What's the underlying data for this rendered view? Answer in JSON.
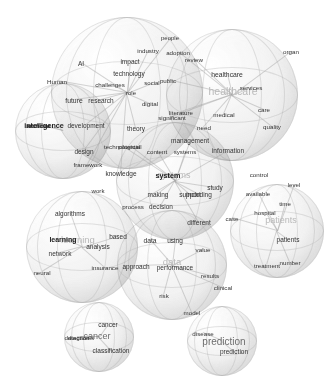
{
  "figure": {
    "title": "",
    "type": "bubble-word-cloud",
    "background_color": "#ffffff",
    "bubble_fill": "#ececec",
    "bubble_edge": "#c8c8c8",
    "topic_label_color": "#b9b9b9",
    "word_color": "#3c3c3c"
  },
  "chart_data": {
    "type": "scatter",
    "title": "",
    "xlabel": "",
    "ylabel": "",
    "grid": false,
    "legend": "none",
    "clusters": [
      {
        "id": "artificial-intelligence",
        "topic_label": "artificial intelligence",
        "label_text": "intelligence",
        "cx": 63,
        "cy": 131,
        "r": 48,
        "words": [
          {
            "text": "intelligence",
            "x": 44,
            "y": 125,
            "size": 7.2,
            "weight": "bold"
          },
          {
            "text": "artificial",
            "x": 38,
            "y": 125,
            "size": 6.2,
            "weight": "bold"
          }
        ]
      },
      {
        "id": "technology-adoption",
        "topic_label": "",
        "label_text": "",
        "cx": 127,
        "cy": 93,
        "r": 76,
        "words": [
          {
            "text": "AI",
            "x": 81,
            "y": 63,
            "size": 6.5,
            "weight": "normal"
          },
          {
            "text": "Human",
            "x": 57,
            "y": 81,
            "size": 6.2,
            "weight": "normal"
          },
          {
            "text": "impact",
            "x": 130,
            "y": 61,
            "size": 6.5,
            "weight": "normal"
          },
          {
            "text": "industry",
            "x": 148,
            "y": 50,
            "size": 6.2,
            "weight": "normal"
          },
          {
            "text": "technology",
            "x": 129,
            "y": 73,
            "size": 6.5,
            "weight": "normal"
          },
          {
            "text": "challenges",
            "x": 110,
            "y": 84,
            "size": 6.2,
            "weight": "normal"
          },
          {
            "text": "role",
            "x": 131,
            "y": 93,
            "size": 6.0,
            "weight": "normal"
          },
          {
            "text": "social",
            "x": 152,
            "y": 83,
            "size": 6.0,
            "weight": "normal"
          },
          {
            "text": "future",
            "x": 74,
            "y": 100,
            "size": 6.8,
            "weight": "normal"
          },
          {
            "text": "research",
            "x": 101,
            "y": 100,
            "size": 6.5,
            "weight": "normal"
          },
          {
            "text": "development",
            "x": 86,
            "y": 125,
            "size": 6.5,
            "weight": "normal"
          },
          {
            "text": "theory",
            "x": 136,
            "y": 128,
            "size": 6.5,
            "weight": "normal"
          },
          {
            "text": "digital",
            "x": 150,
            "y": 103,
            "size": 6.2,
            "weight": "normal"
          },
          {
            "text": "design",
            "x": 84,
            "y": 151,
            "size": 6.5,
            "weight": "normal"
          },
          {
            "text": "framework",
            "x": 88,
            "y": 164,
            "size": 6.2,
            "weight": "normal"
          },
          {
            "text": "knowledge",
            "x": 121,
            "y": 173,
            "size": 6.5,
            "weight": "normal"
          },
          {
            "text": "work",
            "x": 98,
            "y": 190,
            "size": 6.2,
            "weight": "normal"
          },
          {
            "text": "people",
            "x": 170,
            "y": 38,
            "size": 6.0,
            "weight": "normal"
          }
        ]
      },
      {
        "id": "healthcare",
        "topic_label": "healthcare",
        "label_text": "healthcare",
        "cx": 232,
        "cy": 95,
        "r": 66,
        "words": [
          {
            "text": "healthcare",
            "x": 227,
            "y": 74,
            "size": 6.8,
            "weight": "normal"
          },
          {
            "text": "healthcare",
            "x": 233,
            "y": 91,
            "size": 10.5,
            "weight": "label"
          },
          {
            "text": "services",
            "x": 251,
            "y": 87,
            "size": 6.2,
            "weight": "normal"
          },
          {
            "text": "adoption",
            "x": 178,
            "y": 52,
            "size": 6.2,
            "weight": "normal"
          },
          {
            "text": "review",
            "x": 194,
            "y": 59,
            "size": 6.2,
            "weight": "normal"
          },
          {
            "text": "public",
            "x": 168,
            "y": 80,
            "size": 6.2,
            "weight": "normal"
          },
          {
            "text": "medical",
            "x": 224,
            "y": 114,
            "size": 6.2,
            "weight": "normal"
          },
          {
            "text": "care",
            "x": 264,
            "y": 109,
            "size": 6.2,
            "weight": "normal"
          },
          {
            "text": "quality",
            "x": 272,
            "y": 126,
            "size": 6.2,
            "weight": "normal"
          },
          {
            "text": "organ",
            "x": 291,
            "y": 51,
            "size": 6.2,
            "weight": "normal"
          },
          {
            "text": "literature",
            "x": 181,
            "y": 112,
            "size": 6.2,
            "weight": "normal"
          },
          {
            "text": "significant",
            "x": 172,
            "y": 117,
            "size": 6.2,
            "weight": "normal"
          },
          {
            "text": "need",
            "x": 204,
            "y": 127,
            "size": 6.2,
            "weight": "normal"
          }
        ]
      },
      {
        "id": "systems",
        "topic_label": "systems",
        "label_text": "systems",
        "cx": 175,
        "cy": 181,
        "r": 59,
        "words": [
          {
            "text": "systems",
            "x": 174,
            "y": 175,
            "size": 9.0,
            "weight": "label"
          },
          {
            "text": "system",
            "x": 168,
            "y": 175,
            "size": 7.2,
            "weight": "bold"
          },
          {
            "text": "management",
            "x": 190,
            "y": 140,
            "size": 6.5,
            "weight": "normal"
          },
          {
            "text": "content",
            "x": 157,
            "y": 151,
            "size": 6.2,
            "weight": "normal"
          },
          {
            "text": "systems",
            "x": 185,
            "y": 151,
            "size": 6.2,
            "weight": "normal"
          },
          {
            "text": "information",
            "x": 228,
            "y": 150,
            "size": 6.5,
            "weight": "normal"
          },
          {
            "text": "technological",
            "x": 122,
            "y": 146,
            "size": 6.2,
            "weight": "normal"
          },
          {
            "text": "potential",
            "x": 130,
            "y": 146,
            "size": 6.2,
            "weight": "normal"
          },
          {
            "text": "making",
            "x": 158,
            "y": 194,
            "size": 6.5,
            "weight": "normal"
          },
          {
            "text": "support",
            "x": 190,
            "y": 194,
            "size": 6.5,
            "weight": "normal"
          },
          {
            "text": "including",
            "x": 199,
            "y": 194,
            "size": 6.5,
            "weight": "normal"
          },
          {
            "text": "process",
            "x": 133,
            "y": 206,
            "size": 6.2,
            "weight": "normal"
          },
          {
            "text": "decision",
            "x": 161,
            "y": 206,
            "size": 6.5,
            "weight": "normal"
          },
          {
            "text": "study",
            "x": 215,
            "y": 187,
            "size": 6.5,
            "weight": "normal"
          },
          {
            "text": "different",
            "x": 199,
            "y": 222,
            "size": 6.5,
            "weight": "normal"
          }
        ]
      },
      {
        "id": "learning",
        "topic_label": "learning",
        "label_text": "learning",
        "cx": 82,
        "cy": 247,
        "r": 56,
        "words": [
          {
            "text": "learning",
            "x": 78,
            "y": 239,
            "size": 9.5,
            "weight": "label"
          },
          {
            "text": "learning",
            "x": 63,
            "y": 239,
            "size": 7.0,
            "weight": "bold"
          },
          {
            "text": "algorithms",
            "x": 70,
            "y": 213,
            "size": 6.5,
            "weight": "normal"
          },
          {
            "text": "network",
            "x": 60,
            "y": 253,
            "size": 6.5,
            "weight": "normal"
          },
          {
            "text": "neural",
            "x": 42,
            "y": 272,
            "size": 6.2,
            "weight": "normal"
          },
          {
            "text": "analysis",
            "x": 98,
            "y": 246,
            "size": 6.5,
            "weight": "normal"
          },
          {
            "text": "insurance",
            "x": 105,
            "y": 267,
            "size": 6.2,
            "weight": "normal"
          },
          {
            "text": "based",
            "x": 118,
            "y": 236,
            "size": 6.5,
            "weight": "normal"
          }
        ]
      },
      {
        "id": "data",
        "topic_label": "data",
        "label_text": "data",
        "cx": 172,
        "cy": 265,
        "r": 55,
        "words": [
          {
            "text": "data",
            "x": 172,
            "y": 261,
            "size": 9.5,
            "weight": "label"
          },
          {
            "text": "data",
            "x": 150,
            "y": 240,
            "size": 6.8,
            "weight": "normal"
          },
          {
            "text": "using",
            "x": 175,
            "y": 240,
            "size": 6.5,
            "weight": "normal"
          },
          {
            "text": "value",
            "x": 203,
            "y": 249,
            "size": 6.2,
            "weight": "normal"
          },
          {
            "text": "approach",
            "x": 136,
            "y": 266,
            "size": 6.5,
            "weight": "normal"
          },
          {
            "text": "performance",
            "x": 175,
            "y": 267,
            "size": 6.5,
            "weight": "normal"
          },
          {
            "text": "results",
            "x": 210,
            "y": 275,
            "size": 6.2,
            "weight": "normal"
          },
          {
            "text": "clinical",
            "x": 223,
            "y": 287,
            "size": 6.2,
            "weight": "normal"
          },
          {
            "text": "risk",
            "x": 164,
            "y": 295,
            "size": 6.2,
            "weight": "normal"
          },
          {
            "text": "model",
            "x": 192,
            "y": 312,
            "size": 6.2,
            "weight": "normal"
          }
        ]
      },
      {
        "id": "patients",
        "topic_label": "patients",
        "label_text": "patients",
        "cx": 277,
        "cy": 231,
        "r": 47,
        "words": [
          {
            "text": "patients",
            "x": 281,
            "y": 220,
            "size": 9.0,
            "weight": "label"
          },
          {
            "text": "patients",
            "x": 288,
            "y": 239,
            "size": 6.5,
            "weight": "normal"
          },
          {
            "text": "hospital",
            "x": 265,
            "y": 212,
            "size": 6.2,
            "weight": "normal"
          },
          {
            "text": "time",
            "x": 285,
            "y": 203,
            "size": 6.2,
            "weight": "normal"
          },
          {
            "text": "level",
            "x": 294,
            "y": 184,
            "size": 6.2,
            "weight": "normal"
          },
          {
            "text": "available",
            "x": 258,
            "y": 193,
            "size": 6.2,
            "weight": "normal"
          },
          {
            "text": "control",
            "x": 259,
            "y": 174,
            "size": 6.2,
            "weight": "normal"
          },
          {
            "text": "case",
            "x": 232,
            "y": 218,
            "size": 6.2,
            "weight": "normal"
          },
          {
            "text": "treatment",
            "x": 267,
            "y": 265,
            "size": 6.2,
            "weight": "normal"
          },
          {
            "text": "number",
            "x": 290,
            "y": 262,
            "size": 6.2,
            "weight": "normal"
          }
        ]
      },
      {
        "id": "cancer",
        "topic_label": "cancer",
        "label_text": "cancer",
        "cx": 99,
        "cy": 337,
        "r": 35,
        "words": [
          {
            "text": "cancer",
            "x": 97,
            "y": 336,
            "size": 9.0,
            "weight": "bold-label"
          },
          {
            "text": "cancer",
            "x": 108,
            "y": 324,
            "size": 6.5,
            "weight": "normal"
          },
          {
            "text": "detection",
            "x": 77,
            "y": 337,
            "size": 6.2,
            "weight": "normal"
          },
          {
            "text": "diagnosis",
            "x": 81,
            "y": 337,
            "size": 6.2,
            "weight": "normal"
          },
          {
            "text": "classification",
            "x": 111,
            "y": 350,
            "size": 6.5,
            "weight": "normal"
          }
        ]
      },
      {
        "id": "prediction",
        "topic_label": "prediction",
        "label_text": "prediction",
        "cx": 222,
        "cy": 341,
        "r": 35,
        "words": [
          {
            "text": "prediction",
            "x": 224,
            "y": 341,
            "size": 10.0,
            "weight": "bold-label"
          },
          {
            "text": "disease",
            "x": 203,
            "y": 333,
            "size": 6.2,
            "weight": "normal"
          },
          {
            "text": "prediction",
            "x": 234,
            "y": 351,
            "size": 6.5,
            "weight": "normal"
          }
        ]
      }
    ]
  }
}
